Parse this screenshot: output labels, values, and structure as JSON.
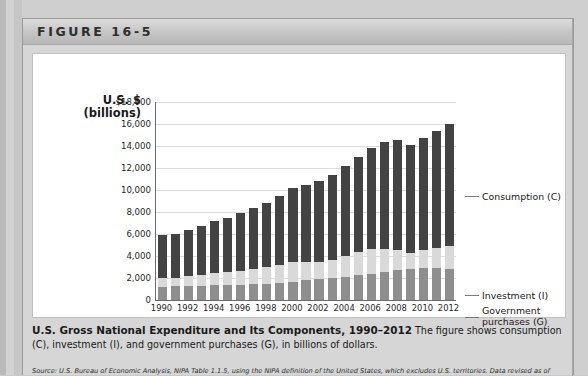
{
  "figure": {
    "header_label": "FIGURE 16-5",
    "caption_title": "U.S. Gross National Expenditure and Its Components, 1990–2012",
    "caption_body": "The figure shows consumption (C), investment (I), and government purchases (G), in billions of dollars.",
    "source": "Source: U.S. Bureau of Economic Analysis, NIPA Table 1.1.5, using the NIPA definition of the United States, which excludes U.S. territories. Data revised as of"
  },
  "callouts": {
    "consumption": "Consumption (C)",
    "investment": "Investment (I)",
    "government_line1": "Government",
    "government_line2": "purchases (G)"
  },
  "colors": {
    "consumption": "#434343",
    "investment": "#d9d9d9",
    "government": "#8e8e8e",
    "axis": "#6b6b6b",
    "grid": "#dcdcdc",
    "panel_background": "#d6d6d6",
    "plot_background": "#ffffff"
  },
  "chart_data": {
    "type": "bar",
    "subtype": "stacked",
    "title": "U.S. Gross National Expenditure and Its Components, 1990–2012",
    "xlabel": "",
    "ylabel": "U.S. $ (billions)",
    "ylabel_line1": "U.S. $",
    "ylabel_line2": "(billions)",
    "ylim": [
      0,
      18000
    ],
    "ytick_values": [
      0,
      2000,
      4000,
      6000,
      8000,
      10000,
      12000,
      14000,
      16000,
      18000
    ],
    "ytick_labels": [
      "0",
      "2,000",
      "4,000",
      "6,000",
      "8,000",
      "10,000",
      "12,000",
      "14,000",
      "16,000",
      "$18,000"
    ],
    "grid": true,
    "legend_position": "right-callouts",
    "categories": [
      1990,
      1991,
      1992,
      1993,
      1994,
      1995,
      1996,
      1997,
      1998,
      1999,
      2000,
      2001,
      2002,
      2003,
      2004,
      2005,
      2006,
      2007,
      2008,
      2009,
      2010,
      2011,
      2012
    ],
    "xtick_labels": [
      "1990",
      "1992",
      "1994",
      "1996",
      "1998",
      "2000",
      "2002",
      "2004",
      "2006",
      "2008",
      "2010",
      "2012"
    ],
    "series": [
      {
        "name": "Government purchases (G)",
        "key": "government",
        "color": "#8e8e8e",
        "values": [
          1180,
          1230,
          1270,
          1290,
          1320,
          1370,
          1410,
          1450,
          1500,
          1580,
          1670,
          1780,
          1890,
          2000,
          2120,
          2250,
          2380,
          2520,
          2740,
          2840,
          2900,
          2880,
          2850
        ]
      },
      {
        "name": "Investment (I)",
        "key": "investment",
        "color": "#d9d9d9",
        "values": [
          860,
          810,
          880,
          980,
          1100,
          1150,
          1250,
          1390,
          1510,
          1640,
          1780,
          1650,
          1600,
          1670,
          1890,
          2090,
          2230,
          2130,
          1840,
          1400,
          1670,
          1820,
          2060
        ]
      },
      {
        "name": "Consumption (C)",
        "key": "consumption",
        "color": "#434343",
        "values": [
          3830,
          3970,
          4210,
          4450,
          4720,
          4950,
          5230,
          5510,
          5840,
          6250,
          6740,
          7050,
          7350,
          7700,
          8200,
          8700,
          9200,
          9700,
          9980,
          9850,
          10200,
          10700,
          11100
        ]
      }
    ],
    "totals": [
      5870,
      6010,
      6360,
      6720,
      7140,
      7470,
      7890,
      8350,
      8850,
      9470,
      10190,
      10480,
      10840,
      11370,
      12210,
      13040,
      13810,
      14350,
      14560,
      14090,
      14770,
      15400,
      16010
    ]
  }
}
